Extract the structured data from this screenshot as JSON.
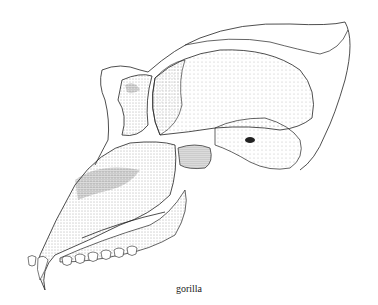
{
  "figure": {
    "caption": "gorilla"
  }
}
